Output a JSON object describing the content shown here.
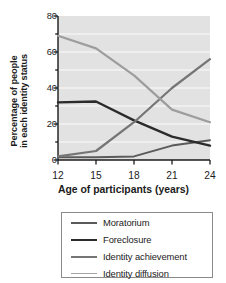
{
  "chart_data": {
    "type": "line",
    "title": "",
    "xlabel": "Age of participants (years)",
    "ylabel_line1": "Percentage of people",
    "ylabel_line2": "in each identity status",
    "x": [
      12,
      15,
      18,
      21,
      24
    ],
    "xticks": [
      "12",
      "15",
      "18",
      "21",
      "24"
    ],
    "yticks": [
      "0",
      "20",
      "40",
      "60",
      "80"
    ],
    "xlim": [
      12,
      24
    ],
    "ylim": [
      0,
      80
    ],
    "grid": "horizontal-white-gridlines-every-10",
    "plot_background": "#e2e2e2",
    "legend_position": "below-plot",
    "series": [
      {
        "name": "Moratorium",
        "color": "#5a5a5a",
        "width": 2.0,
        "values": [
          1.5,
          1.5,
          2,
          8,
          11
        ]
      },
      {
        "name": "Foreclosure",
        "color": "#2b2b2b",
        "width": 2.4,
        "values": [
          32,
          32.5,
          22,
          13,
          8
        ]
      },
      {
        "name": "Identity achievement",
        "color": "#757575",
        "width": 2.2,
        "values": [
          2,
          5,
          21,
          40,
          56
        ]
      },
      {
        "name": "Identity diffusion",
        "color": "#9d9d9d",
        "width": 2.2,
        "values": [
          69,
          62,
          47,
          28,
          21
        ]
      }
    ]
  },
  "legend": {
    "items": [
      {
        "label": "Moratorium"
      },
      {
        "label": "Foreclosure"
      },
      {
        "label": "Identity achievement"
      },
      {
        "label": "Identity diffusion"
      }
    ]
  }
}
